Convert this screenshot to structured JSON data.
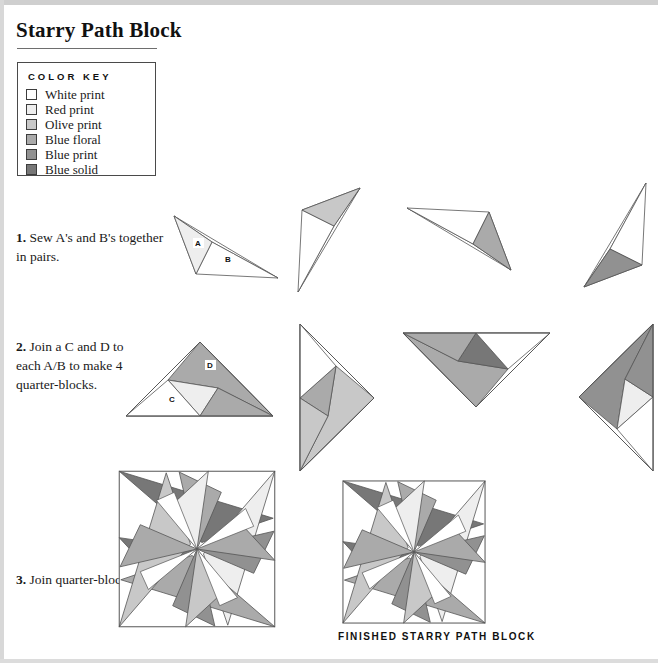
{
  "title": "Starry Path Block",
  "color_key": {
    "heading": "COLOR KEY",
    "items": [
      {
        "label": "White print",
        "color": "#ffffff"
      },
      {
        "label": "Red print",
        "color": "#eeeeee"
      },
      {
        "label": "Olive print",
        "color": "#c8c8c8"
      },
      {
        "label": "Blue floral",
        "color": "#aaaaaa"
      },
      {
        "label": "Blue print",
        "color": "#919191"
      },
      {
        "label": "Blue solid",
        "color": "#777777"
      }
    ]
  },
  "steps": [
    {
      "num": "1.",
      "text": " Sew A's and B's together in pairs."
    },
    {
      "num": "2.",
      "text": " Join a C and D to each A/B to make 4 quarter-blocks."
    },
    {
      "num": "3.",
      "text": " Join quarter-blocks."
    }
  ],
  "piece_labels": {
    "a": "A",
    "b": "B",
    "c": "C",
    "d": "D"
  },
  "finished_caption": "FINISHED STARRY PATH BLOCK",
  "outline_color": "#555555",
  "row1_pairs": [
    {
      "a_color": "#eeeeee",
      "b_color": "#ffffff",
      "rotation": 0
    },
    {
      "a_color": "#c8c8c8",
      "b_color": "#ffffff",
      "rotation": 90
    },
    {
      "a_color": "#aaaaaa",
      "b_color": "#ffffff",
      "rotation": 180
    },
    {
      "a_color": "#919191",
      "b_color": "#ffffff",
      "rotation": 270
    }
  ],
  "row2_quarters": [
    {
      "c_color": "#ffffff",
      "d_color": "#aaaaaa",
      "a_color": "#eeeeee",
      "b_color": "#ffffff",
      "rotation": 0
    },
    {
      "c_color": "#ffffff",
      "d_color": "#c8c8c8",
      "a_color": "#aaaaaa",
      "b_color": "#ffffff",
      "rotation": 90
    },
    {
      "c_color": "#ffffff",
      "d_color": "#aaaaaa",
      "a_color": "#777777",
      "b_color": "#ffffff",
      "rotation": 180
    },
    {
      "c_color": "#ffffff",
      "d_color": "#919191",
      "a_color": "#eeeeee",
      "b_color": "#ffffff",
      "rotation": 270
    }
  ],
  "block_quadrants": {
    "top_left": {
      "star_point": "#777777",
      "inner": "#aaaaaa",
      "background": "#ffffff"
    },
    "top_right": {
      "star_point": "#eeeeee",
      "inner": "#919191",
      "background": "#ffffff"
    },
    "bottom_right": {
      "star_point": "#aaaaaa",
      "inner": "#919191",
      "background": "#ffffff"
    },
    "bottom_left": {
      "star_point": "#c8c8c8",
      "inner": "#aaaaaa",
      "background": "#ffffff"
    }
  }
}
